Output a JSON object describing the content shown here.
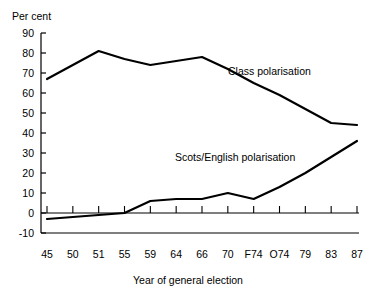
{
  "chart_data": {
    "type": "line",
    "title": "",
    "xlabel": "Year of general election",
    "ylabel": "Per cent",
    "ylim": [
      -10,
      90
    ],
    "ytick_values": [
      90,
      80,
      70,
      60,
      50,
      40,
      30,
      20,
      10,
      0,
      -10
    ],
    "ytick_labels": [
      "90",
      "80",
      "70",
      "60",
      "50",
      "40",
      "30",
      "20",
      "10",
      "0",
      "-10"
    ],
    "grid": false,
    "legend_position": "inline-annotation",
    "categories": [
      "45",
      "50",
      "51",
      "55",
      "59",
      "64",
      "66",
      "70",
      "F74",
      "O74",
      "79",
      "83",
      "87"
    ],
    "series": [
      {
        "name": "Class polarisation",
        "values": [
          67,
          74,
          81,
          77,
          74,
          76,
          78,
          72,
          65,
          59,
          52,
          45,
          44
        ],
        "color": "#000000"
      },
      {
        "name": "Scots/English polarisation",
        "values": [
          -3,
          -2,
          -1,
          0,
          6,
          7,
          7,
          10,
          7,
          13,
          20,
          28,
          36
        ],
        "color": "#000000"
      }
    ],
    "annotations": [
      {
        "text": "Class polarisation",
        "x": "66",
        "y": 73
      },
      {
        "text": "Scots/English polarisation",
        "x": "70",
        "y": 31
      }
    ]
  },
  "axes": {
    "y_axis_title": "Per cent",
    "x_axis_title": "Year of general election"
  },
  "colors": {
    "line": "#000000",
    "axis": "#000000",
    "background": "#ffffff"
  }
}
